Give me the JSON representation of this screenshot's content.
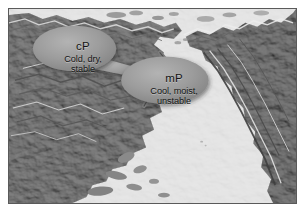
{
  "figure": {
    "kind": "air-mass-source-region-map",
    "region_depicted": "North Pacific — eastern Asia and western North America",
    "frame_border_color": "#5a5a5a",
    "ocean_color": "#efefef",
    "land_color": "#8e8e8e",
    "callout_fill": "#9a9a9a",
    "text_color": "#151515"
  },
  "callouts": [
    {
      "id": "cP",
      "code": "cP",
      "description_lines": [
        "Cold, dry,",
        "stable"
      ],
      "description": "Cold, dry, stable",
      "meaning": "continental Polar"
    },
    {
      "id": "mP",
      "code": "mP",
      "description_lines": [
        "Cool, moist,",
        "unstable"
      ],
      "description": "Cool, moist, unstable",
      "meaning": "maritime Polar"
    }
  ]
}
